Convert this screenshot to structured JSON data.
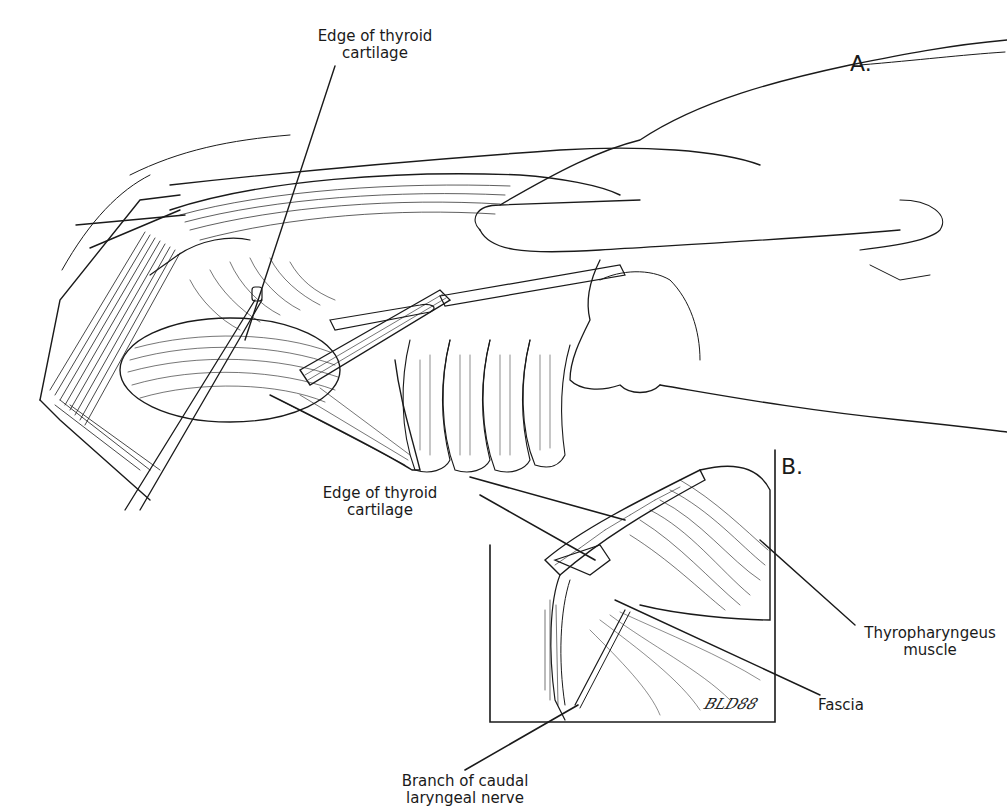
{
  "figure": {
    "type": "surgical anatomical line illustration",
    "panels": [
      {
        "id": "A",
        "label": "A."
      },
      {
        "id": "B",
        "label": "B."
      }
    ],
    "labels": {
      "a_edge_thyroid_line1": "Edge of thyroid",
      "a_edge_thyroid_line2": "cartilage",
      "b_edge_thyroid_line1": "Edge of thyroid",
      "b_edge_thyroid_line2": "cartilage",
      "thyropharyngeus_line1": "Thyropharyngeus",
      "thyropharyngeus_line2": "muscle",
      "fascia": "Fascia",
      "nerve_line1": "Branch of caudal",
      "nerve_line2": "laryngeal nerve"
    },
    "signature": "BLD88",
    "colors": {
      "ink": "#1a1a1a",
      "background": "#ffffff"
    }
  }
}
